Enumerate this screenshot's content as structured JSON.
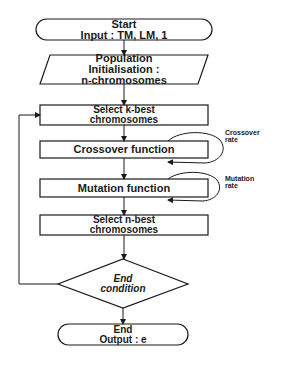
{
  "diagram": {
    "type": "flowchart",
    "colors": {
      "stroke": "#1a1a1a",
      "fill": "#ffffff",
      "text": "#1a1a1a"
    },
    "nodes": {
      "start": {
        "shape": "terminator",
        "line1": "Start",
        "line2": "Input : TM, LM, 1"
      },
      "population": {
        "shape": "parallelogram",
        "line1": "Population",
        "line2": "Initialisation :",
        "line3": "n-chromosomes"
      },
      "select_k": {
        "shape": "process",
        "line1": "Select k-best",
        "line2": "chromosomes"
      },
      "crossover": {
        "shape": "process",
        "line1": "Crossover function"
      },
      "mutation": {
        "shape": "process",
        "line1": "Mutation function"
      },
      "select_n": {
        "shape": "process",
        "line1": "Select n-best",
        "line2": "chromosomes"
      },
      "end_condition": {
        "shape": "decision",
        "line1": "End",
        "line2": "condition"
      },
      "end": {
        "shape": "terminator",
        "line1": "End",
        "line2": "Output : e"
      }
    },
    "annotations": {
      "crossover_rate": {
        "line1": "Crossover",
        "line2": "rate"
      },
      "mutation_rate": {
        "line1": "Mutation",
        "line2": "rate"
      }
    },
    "edges": [
      {
        "from": "start",
        "to": "population"
      },
      {
        "from": "population",
        "to": "select_k"
      },
      {
        "from": "select_k",
        "to": "crossover"
      },
      {
        "from": "crossover",
        "to": "crossover",
        "label": "Crossover rate"
      },
      {
        "from": "crossover",
        "to": "mutation"
      },
      {
        "from": "mutation",
        "to": "mutation",
        "label": "Mutation rate"
      },
      {
        "from": "mutation",
        "to": "select_n"
      },
      {
        "from": "select_n",
        "to": "end_condition"
      },
      {
        "from": "end_condition",
        "to": "select_k",
        "label": "loop back"
      },
      {
        "from": "end_condition",
        "to": "end"
      }
    ]
  }
}
